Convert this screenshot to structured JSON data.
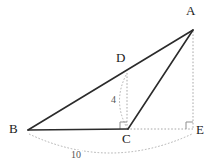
{
  "figure": {
    "background_color": "#ffffff",
    "solid_stroke_color": "#2b2b2b",
    "dashed_stroke_color": "#a8a8a8",
    "label_color": "#1a1a1a",
    "measure_color": "#555555"
  },
  "points": [
    {
      "id": "A",
      "label": "A",
      "x": 193,
      "y": 30,
      "label_x": 188,
      "label_y": 6
    },
    {
      "id": "B",
      "label": "B",
      "x": 28,
      "y": 130,
      "label_x": 10,
      "label_y": 124
    },
    {
      "id": "C",
      "label": "C",
      "x": 127,
      "y": 129,
      "label_x": 122,
      "label_y": 133
    },
    {
      "id": "D",
      "label": "D",
      "x": 127,
      "y": 73,
      "label_x": 117,
      "label_y": 52
    },
    {
      "id": "E",
      "label": "E",
      "x": 193,
      "y": 129,
      "label_x": 197,
      "label_y": 129
    }
  ],
  "solid_segments": [
    {
      "name": "segment-B-A",
      "from": "B",
      "to": "A"
    },
    {
      "name": "segment-B-C",
      "from": "B",
      "to": "C"
    },
    {
      "name": "segment-C-A",
      "from": "C",
      "to": "A"
    }
  ],
  "dashed_segments": [
    {
      "name": "segment-D-C-altitude",
      "from": "D",
      "to": "C"
    },
    {
      "name": "segment-A-E-vertical",
      "from": "A",
      "to": "E"
    },
    {
      "name": "segment-C-E-baseline",
      "from": "C",
      "to": "E"
    }
  ],
  "right_angle_markers": [
    {
      "name": "right-angle-at-C",
      "x": 127,
      "y": 129
    },
    {
      "name": "right-angle-at-E",
      "x": 193,
      "y": 129
    }
  ],
  "measurements": [
    {
      "name": "measure-height-4",
      "value": "4",
      "label_x": 110,
      "label_y": 95,
      "arc_path": "M 126 75 Q 113 101 126 126",
      "describes": "D to C"
    },
    {
      "name": "measure-base-10",
      "value": "10",
      "label_x": 70,
      "label_y": 150,
      "arc_path": "M 29 134 Q 110 172 192 134",
      "describes": "B to E"
    }
  ]
}
